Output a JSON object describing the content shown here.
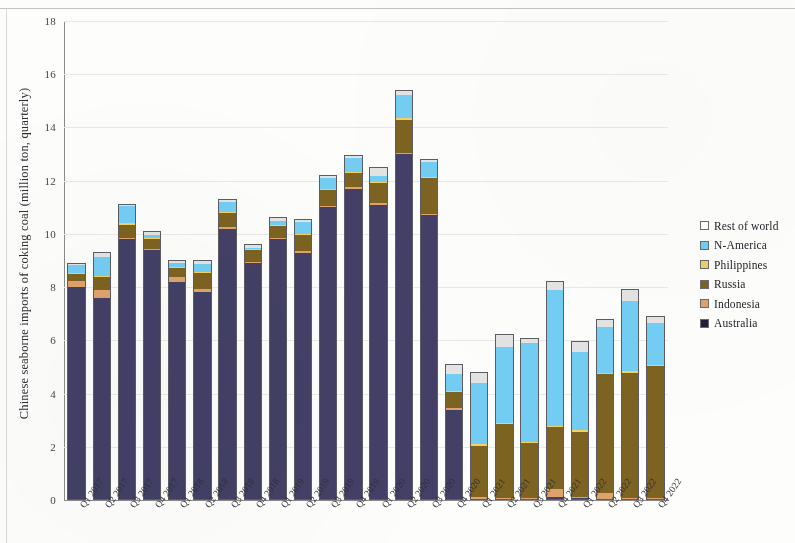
{
  "chart_data": {
    "type": "bar",
    "subtype": "stacked-bar",
    "title": "",
    "xlabel": "",
    "ylabel": "Chinese seaborne imports of coking coal (million ton, quarterly)",
    "ylim": [
      0,
      18
    ],
    "ytick_step": 2,
    "yticks": [
      "0",
      "2",
      "4",
      "6",
      "8",
      "10",
      "12",
      "14",
      "16",
      "18"
    ],
    "grid": true,
    "legend_position": "right",
    "stack_order_bottom_to_top": [
      "Australia",
      "Indonesia",
      "Russia",
      "Philippines",
      "N-America",
      "Rest of world"
    ],
    "categories": [
      "Q1 2017",
      "Q2 2017",
      "Q3 2017",
      "Q4 2017",
      "Q1 2018",
      "Q2 2018",
      "Q3 2018",
      "Q4 2018",
      "Q1 2019",
      "Q2 2019",
      "Q3 2019",
      "Q4 2019",
      "Q1 2020",
      "Q2 2020",
      "Q3 2020",
      "Q4 2020",
      "Q1 2021",
      "Q2 2021",
      "Q3 2021",
      "Q4 2021",
      "Q1 2022",
      "Q2 2022",
      "Q3 2022",
      "Q4 2022"
    ],
    "series": [
      {
        "name": "Australia",
        "color": "#433f66",
        "values": [
          8.0,
          7.6,
          9.8,
          9.4,
          8.2,
          7.8,
          10.2,
          8.9,
          9.8,
          9.3,
          11.0,
          11.7,
          11.1,
          13.0,
          10.7,
          3.4,
          0.05,
          0.04,
          0.04,
          0.12,
          0.08,
          0.05,
          0.04,
          0.04
        ]
      },
      {
        "name": "Indonesia",
        "color": "#e0a26a",
        "values": [
          0.22,
          0.28,
          0.05,
          0.05,
          0.18,
          0.12,
          0.04,
          0.04,
          0.04,
          0.04,
          0.04,
          0.04,
          0.04,
          0.04,
          0.04,
          0.04,
          0.04,
          0.04,
          0.04,
          0.28,
          0.04,
          0.22,
          0.04,
          0.04
        ]
      },
      {
        "name": "Russia",
        "color": "#7d6321",
        "values": [
          0.28,
          0.5,
          0.5,
          0.35,
          0.35,
          0.6,
          0.55,
          0.45,
          0.45,
          0.6,
          0.6,
          0.55,
          0.75,
          1.25,
          1.35,
          0.6,
          1.95,
          2.75,
          2.05,
          2.35,
          2.45,
          4.45,
          4.7,
          4.95
        ]
      },
      {
        "name": "Philippines",
        "color": "#f2d264",
        "values": [
          0.03,
          0.03,
          0.03,
          0.03,
          0.03,
          0.03,
          0.03,
          0.03,
          0.03,
          0.03,
          0.03,
          0.03,
          0.03,
          0.03,
          0.03,
          0.03,
          0.03,
          0.03,
          0.03,
          0.03,
          0.03,
          0.03,
          0.03,
          0.03
        ]
      },
      {
        "name": "N-America",
        "color": "#73cdf2",
        "values": [
          0.3,
          0.7,
          0.65,
          0.1,
          0.15,
          0.3,
          0.35,
          0.05,
          0.15,
          0.45,
          0.4,
          0.5,
          0.25,
          0.9,
          0.55,
          0.65,
          2.3,
          2.85,
          3.7,
          5.1,
          2.95,
          1.75,
          2.65,
          1.55
        ]
      },
      {
        "name": "Rest of world",
        "color": "#e3e3e3",
        "values": [
          0.07,
          0.19,
          0.07,
          0.17,
          0.09,
          0.15,
          0.13,
          0.13,
          0.13,
          0.13,
          0.13,
          0.11,
          0.32,
          0.18,
          0.11,
          0.37,
          0.43,
          0.51,
          0.22,
          0.33,
          0.4,
          0.3,
          0.44,
          0.28
        ]
      }
    ],
    "totals": [
      8.9,
      9.3,
      11.1,
      10.1,
      9.0,
      8.98,
      11.29,
      9.59,
      10.58,
      10.53,
      12.18,
      12.91,
      12.47,
      15.4,
      12.8,
      5.11,
      4.8,
      6.25,
      6.05,
      8.19,
      5.92,
      6.78,
      7.88,
      6.87
    ]
  },
  "legend": {
    "items": [
      {
        "label": "Rest of world",
        "color": "#ffffff"
      },
      {
        "label": "N-America",
        "color": "#73cdf2"
      },
      {
        "label": "Philippines",
        "color": "#f2d264"
      },
      {
        "label": "Russia",
        "color": "#7d6321"
      },
      {
        "label": "Indonesia",
        "color": "#e0a26a"
      },
      {
        "label": "Australia",
        "color": "#1f1f3d"
      }
    ]
  }
}
